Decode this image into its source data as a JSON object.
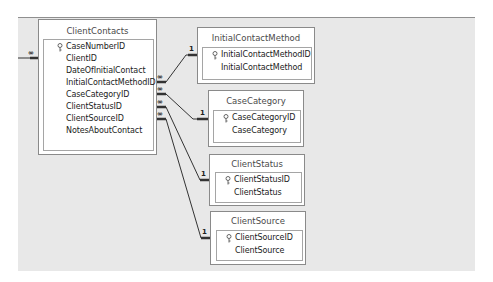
{
  "diagram": {
    "type": "database-relationships",
    "tables": [
      {
        "name": "ClientContacts",
        "fields": [
          {
            "name": "CaseNumberID",
            "primary_key": true
          },
          {
            "name": "ClientID",
            "primary_key": false
          },
          {
            "name": "DateOfInitialContact",
            "primary_key": false
          },
          {
            "name": "InitialContactMethodID",
            "primary_key": false
          },
          {
            "name": "CaseCategoryID",
            "primary_key": false
          },
          {
            "name": "ClientStatusID",
            "primary_key": false
          },
          {
            "name": "ClientSourceID",
            "primary_key": false
          },
          {
            "name": "NotesAboutContact",
            "primary_key": false
          }
        ]
      },
      {
        "name": "InitialContactMethod",
        "fields": [
          {
            "name": "InitialContactMethodID",
            "primary_key": true
          },
          {
            "name": "InitialContactMethod",
            "primary_key": false
          }
        ]
      },
      {
        "name": "CaseCategory",
        "fields": [
          {
            "name": "CaseCategoryID",
            "primary_key": true
          },
          {
            "name": "CaseCategory",
            "primary_key": false
          }
        ]
      },
      {
        "name": "ClientStatus",
        "fields": [
          {
            "name": "ClientStatusID",
            "primary_key": true
          },
          {
            "name": "ClientStatus",
            "primary_key": false
          }
        ]
      },
      {
        "name": "ClientSource",
        "fields": [
          {
            "name": "ClientSourceID",
            "primary_key": true
          },
          {
            "name": "ClientSource",
            "primary_key": false
          }
        ]
      }
    ],
    "relationships": [
      {
        "from": "ClientContacts.InitialContactMethodID",
        "to": "InitialContactMethod.InitialContactMethodID",
        "many_label": "∞",
        "one_label": "1"
      },
      {
        "from": "ClientContacts.CaseCategoryID",
        "to": "CaseCategory.CaseCategoryID",
        "many_label": "∞",
        "one_label": "1"
      },
      {
        "from": "ClientContacts.ClientStatusID",
        "to": "ClientStatus.ClientStatusID",
        "many_label": "∞",
        "one_label": "1"
      },
      {
        "from": "ClientContacts.ClientSourceID",
        "to": "ClientSource.ClientSourceID",
        "many_label": "∞",
        "one_label": "1"
      },
      {
        "from": "(offscreen)",
        "to": "ClientContacts",
        "many_label": "∞",
        "one_label": ""
      }
    ],
    "colors": {
      "canvas": "#e8e8e8",
      "table_border": "#8a8a8a",
      "line": "#333333"
    }
  }
}
